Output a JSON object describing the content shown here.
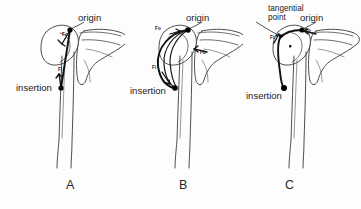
{
  "figure": {
    "background_color": "#fdfdfd",
    "ink_color": "#1b1b1b",
    "bone_stroke_color": "#3a3a3a",
    "muscle_stroke_color": "#111111"
  },
  "panels": [
    {
      "id": "A",
      "letter": "A",
      "letter_x": 68,
      "letter_y": 180,
      "model": "straight-line",
      "labels": {
        "origin": "origin",
        "insertion": "insertion"
      },
      "force_labels": [
        {
          "text": "Fo",
          "x": 61,
          "y": 35
        },
        {
          "text": "Fi",
          "x": 59,
          "y": 69
        }
      ]
    },
    {
      "id": "B",
      "letter": "B",
      "letter_x": 180,
      "letter_y": 180,
      "model": "via-points / curved path",
      "labels": {
        "origin": "origin",
        "insertion": "insertion"
      },
      "force_labels": [
        {
          "text": "Fo",
          "x": 155,
          "y": 28
        },
        {
          "text": "Fb",
          "x": 196,
          "y": 54
        },
        {
          "text": "Fi",
          "x": 152,
          "y": 68
        }
      ]
    },
    {
      "id": "C",
      "letter": "C",
      "letter_x": 287,
      "letter_y": 180,
      "model": "obstacle / tangential wrapping",
      "labels": {
        "origin": "origin",
        "insertion": "insertion",
        "tangential_point_line1": "tangential",
        "tangential_point_line2": "point"
      },
      "force_labels": [
        {
          "text": "Ft",
          "x": 272,
          "y": 38
        },
        {
          "text": "Fo",
          "x": 305,
          "y": 31
        }
      ]
    }
  ],
  "text_items": {
    "origin_a": "origin",
    "origin_b": "origin",
    "origin_c": "origin",
    "insertion_a": "insertion",
    "insertion_b": "insertion",
    "insertion_c": "insertion",
    "tangential_l1": "tangential",
    "tangential_l2": "point",
    "letter_a": "A",
    "letter_b": "B",
    "letter_c": "C",
    "fo_a": "Fo",
    "fi_a": "Fi",
    "fo_b": "Fo",
    "fb_b": "Fb",
    "fi_b": "Fi",
    "ft_c": "Ft",
    "fo_c": "Fo"
  }
}
